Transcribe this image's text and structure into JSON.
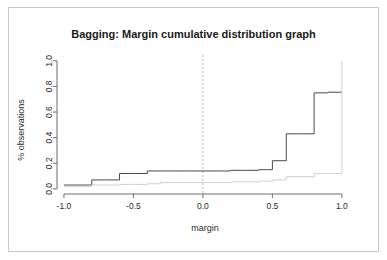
{
  "figure": {
    "width": 387,
    "height": 260,
    "background": "#ffffff",
    "border_color": "#c9c9c9"
  },
  "chart_data": {
    "type": "line",
    "subtype": "step-ecdf",
    "title": "Bagging: Margin cumulative distribution graph",
    "xlabel": "margin",
    "ylabel": "% observations",
    "xlim": [
      -1.05,
      1.08
    ],
    "ylim": [
      -0.04,
      1.03
    ],
    "grid": false,
    "legend": "none",
    "xticks": [
      -1.0,
      -0.5,
      0.0,
      0.5,
      1.0
    ],
    "xtick_labels": [
      "-1.0",
      "-0.5",
      "0.0",
      "0.5",
      "1.0"
    ],
    "yticks": [
      0.0,
      0.2,
      0.4,
      0.6,
      0.8,
      1.0
    ],
    "ytick_labels": [
      "0.0",
      "0.2",
      "0.4",
      "0.6",
      "0.8",
      "1.0"
    ],
    "ytick_label_rotation": -90,
    "annotations": [
      {
        "name": "zero-margin-reference-line",
        "type": "vline",
        "x": 0.0,
        "style": "dashed",
        "color": "#b6b6b6"
      }
    ],
    "series": [
      {
        "name": "margin-cumulative-distribution",
        "label": "cumulative distribution",
        "color": "#4a4a4a",
        "linewidth": 1,
        "style": "step-post",
        "x": [
          -1.0,
          -0.9,
          -0.8,
          -0.7,
          -0.6,
          -0.5,
          -0.4,
          -0.3,
          -0.2,
          -0.1,
          0.0,
          0.1,
          0.2,
          0.3,
          0.4,
          0.5,
          0.6,
          0.7,
          0.8,
          0.9,
          1.0
        ],
        "y": [
          0.03,
          0.03,
          0.07,
          0.07,
          0.12,
          0.12,
          0.14,
          0.14,
          0.14,
          0.14,
          0.14,
          0.14,
          0.145,
          0.145,
          0.15,
          0.22,
          0.43,
          0.43,
          0.75,
          0.755,
          0.755
        ]
      },
      {
        "name": "margin-secondary-distribution",
        "label": "secondary distribution",
        "color": "#cfcfcf",
        "linewidth": 1,
        "style": "step-post",
        "x": [
          -1.0,
          -0.9,
          -0.8,
          -0.7,
          -0.6,
          -0.5,
          -0.4,
          -0.3,
          -0.2,
          -0.1,
          0.0,
          0.1,
          0.2,
          0.3,
          0.4,
          0.5,
          0.6,
          0.7,
          0.8,
          0.9,
          1.0,
          1.0
        ],
        "y": [
          0.02,
          0.02,
          0.03,
          0.03,
          0.035,
          0.035,
          0.04,
          0.05,
          0.05,
          0.05,
          0.05,
          0.05,
          0.055,
          0.055,
          0.06,
          0.07,
          0.095,
          0.095,
          0.12,
          0.12,
          0.125,
          1.0
        ]
      }
    ]
  }
}
